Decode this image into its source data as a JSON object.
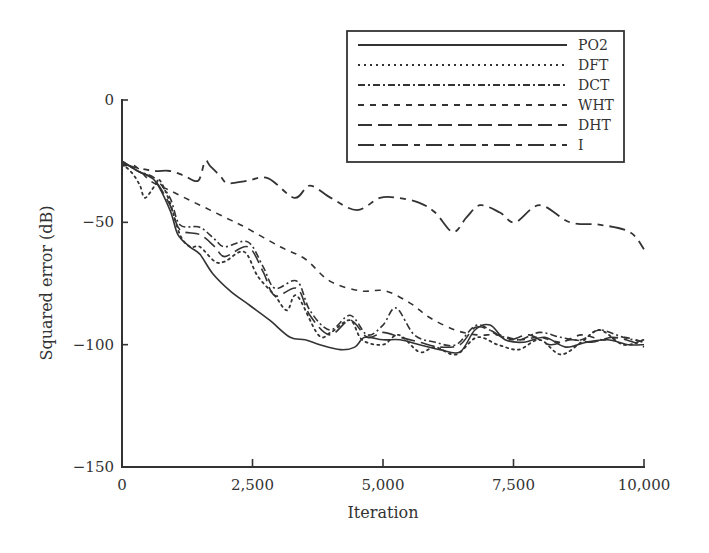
{
  "chart_data": {
    "type": "line",
    "title": "",
    "xlabel": "Iteration",
    "ylabel": "Squared error (dB)",
    "xlim": [
      0,
      10000
    ],
    "ylim": [
      -150,
      0
    ],
    "x_ticks": [
      0,
      2500,
      5000,
      7500,
      10000
    ],
    "x_tick_labels": [
      "0",
      "2,500",
      "5,000",
      "7,500",
      "10,000"
    ],
    "y_ticks": [
      0,
      -50,
      -100,
      -150
    ],
    "y_tick_labels": [
      "0",
      "−50",
      "−100",
      "−150"
    ],
    "grid": false,
    "legend_position": "upper right",
    "series": [
      {
        "name": "PO2",
        "style": "solid",
        "x": [
          0,
          300,
          630,
          920,
          1070,
          1300,
          1490,
          1740,
          2070,
          2450,
          2830,
          3220,
          3510,
          3790,
          4180,
          4460,
          4650,
          5000,
          5330,
          5700,
          6090,
          6475,
          6760,
          7050,
          7340,
          7700,
          8100,
          8500,
          8900,
          9300,
          9700,
          10000
        ],
        "y": [
          -25,
          -29,
          -33,
          -45,
          -55,
          -60,
          -63,
          -71,
          -78,
          -84,
          -90,
          -97,
          -98,
          -100,
          -102,
          -101,
          -97,
          -98,
          -98,
          -100,
          -102,
          -103,
          -94,
          -92,
          -98,
          -99,
          -97,
          -101,
          -99,
          -98,
          -100,
          -100
        ]
      },
      {
        "name": "DFT",
        "style": "dotted",
        "x": [
          0,
          200,
          345,
          440,
          630,
          730,
          920,
          1110,
          1300,
          1490,
          1780,
          1970,
          2340,
          2600,
          2930,
          3160,
          3350,
          3760,
          4000,
          4370,
          4600,
          5000,
          5300,
          5700,
          6000,
          6400,
          6800,
          7200,
          7600,
          8000,
          8400,
          8800,
          9150,
          9600,
          10000
        ],
        "y": [
          -26,
          -30,
          -35,
          -40,
          -35,
          -33,
          -42,
          -55,
          -60,
          -60,
          -66,
          -66,
          -62,
          -72,
          -80,
          -86,
          -80,
          -96,
          -95,
          -90,
          -98,
          -100,
          -96,
          -103,
          -101,
          -104,
          -97,
          -100,
          -102,
          -98,
          -104,
          -99,
          -94,
          -100,
          -98
        ]
      },
      {
        "name": "DCT",
        "style": "dash-dot",
        "x": [
          0,
          300,
          630,
          920,
          1110,
          1490,
          1780,
          1970,
          2410,
          2700,
          2930,
          3350,
          3600,
          3980,
          4370,
          4700,
          5000,
          5250,
          5600,
          6000,
          6400,
          6800,
          7200,
          7600,
          8000,
          8400,
          8800,
          9150,
          9600,
          10000
        ],
        "y": [
          -25,
          -29,
          -32,
          -40,
          -51,
          -52,
          -57,
          -60,
          -58,
          -68,
          -77,
          -74,
          -86,
          -94,
          -88,
          -96,
          -92,
          -85,
          -96,
          -99,
          -100,
          -92,
          -96,
          -98,
          -95,
          -97,
          -98,
          -94,
          -97,
          -99
        ]
      },
      {
        "name": "WHT",
        "style": "short-dash",
        "x": [
          0,
          250,
          540,
          920,
          1300,
          1690,
          2070,
          2360,
          3030,
          3510,
          3980,
          4560,
          5040,
          5520,
          5900,
          6380,
          6800,
          7200,
          7600,
          8000,
          8400,
          8800,
          9200,
          9600,
          10000
        ],
        "y": [
          -27,
          -27,
          -33,
          -37,
          -41,
          -45,
          -49,
          -52,
          -60,
          -65,
          -74,
          -78,
          -78,
          -83,
          -89,
          -94,
          -96,
          -96,
          -98,
          -97,
          -99,
          -96,
          -98,
          -97,
          -99
        ]
      },
      {
        "name": "DHT",
        "style": "long-dash",
        "x": [
          0,
          300,
          630,
          920,
          1110,
          1490,
          1780,
          1970,
          2410,
          2700,
          2930,
          3350,
          3600,
          3980,
          4370,
          4700,
          5000,
          5330,
          5700,
          6090,
          6475,
          6760,
          7050,
          7400,
          7800,
          8200,
          8600,
          9000,
          9400,
          9800,
          10000
        ],
        "y": [
          -25,
          -29,
          -33,
          -43,
          -53,
          -55,
          -60,
          -64,
          -60,
          -70,
          -80,
          -77,
          -88,
          -96,
          -90,
          -97,
          -95,
          -97,
          -99,
          -101,
          -100,
          -93,
          -94,
          -98,
          -96,
          -100,
          -98,
          -99,
          -97,
          -99,
          -101
        ]
      },
      {
        "name": "I",
        "style": "long-short-dash",
        "x": [
          0,
          345,
          630,
          920,
          1200,
          1460,
          1590,
          1690,
          1880,
          2030,
          2400,
          2800,
          3300,
          3600,
          4000,
          4500,
          4940,
          5300,
          5700,
          6000,
          6340,
          6600,
          6860,
          7240,
          7530,
          8000,
          8580,
          9160,
          9730,
          10000
        ],
        "y": [
          -26,
          -28,
          -29,
          -29,
          -31,
          -33,
          -25,
          -27,
          -31,
          -34,
          -33,
          -32,
          -40,
          -35,
          -40,
          -45,
          -40,
          -40,
          -42,
          -46,
          -54,
          -48,
          -43,
          -46,
          -50,
          -43,
          -50,
          -51,
          -54,
          -61
        ]
      }
    ]
  },
  "legend": {
    "items": [
      {
        "label": "PO2"
      },
      {
        "label": "DFT"
      },
      {
        "label": "DCT"
      },
      {
        "label": "WHT"
      },
      {
        "label": "DHT"
      },
      {
        "label": "I"
      }
    ]
  },
  "axes": {
    "xlabel": "Iteration",
    "ylabel": "Squared error (dB)"
  }
}
